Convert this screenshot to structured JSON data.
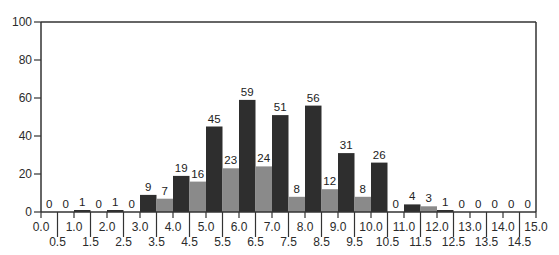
{
  "chart_data": {
    "type": "bar",
    "title": "",
    "xlabel": "",
    "ylabel": "",
    "ylim": [
      0,
      100
    ],
    "xlim": [
      0.0,
      15.0
    ],
    "yticks": [
      0,
      20,
      40,
      60,
      80,
      100
    ],
    "xticks_major": [
      "0.0",
      "1.0",
      "2.0",
      "3.0",
      "4.0",
      "5.0",
      "6.0",
      "7.0",
      "8.0",
      "9.0",
      "10.0",
      "11.0",
      "12.0",
      "13.0",
      "14.0",
      "15.0"
    ],
    "xticks_minor": [
      "0.5",
      "1.5",
      "2.5",
      "3.5",
      "4.5",
      "5.5",
      "6.5",
      "7.5",
      "8.5",
      "9.5",
      "10.5",
      "11.5",
      "12.5",
      "13.5",
      "14.5"
    ],
    "grid": false,
    "legend": null,
    "bin_width": 0.5,
    "bins": [
      {
        "start": 0.0,
        "end": 0.5,
        "value": 0,
        "shade": "dark"
      },
      {
        "start": 0.5,
        "end": 1.0,
        "value": 0,
        "shade": "light"
      },
      {
        "start": 1.0,
        "end": 1.5,
        "value": 1,
        "shade": "dark"
      },
      {
        "start": 1.5,
        "end": 2.0,
        "value": 0,
        "shade": "light"
      },
      {
        "start": 2.0,
        "end": 2.5,
        "value": 1,
        "shade": "dark"
      },
      {
        "start": 2.5,
        "end": 3.0,
        "value": 0,
        "shade": "light"
      },
      {
        "start": 3.0,
        "end": 3.5,
        "value": 9,
        "shade": "dark"
      },
      {
        "start": 3.5,
        "end": 4.0,
        "value": 7,
        "shade": "light"
      },
      {
        "start": 4.0,
        "end": 4.5,
        "value": 19,
        "shade": "dark"
      },
      {
        "start": 4.5,
        "end": 5.0,
        "value": 16,
        "shade": "light"
      },
      {
        "start": 5.0,
        "end": 5.5,
        "value": 45,
        "shade": "dark"
      },
      {
        "start": 5.5,
        "end": 6.0,
        "value": 23,
        "shade": "light"
      },
      {
        "start": 6.0,
        "end": 6.5,
        "value": 59,
        "shade": "dark"
      },
      {
        "start": 6.5,
        "end": 7.0,
        "value": 24,
        "shade": "light"
      },
      {
        "start": 7.0,
        "end": 7.5,
        "value": 51,
        "shade": "dark"
      },
      {
        "start": 7.5,
        "end": 8.0,
        "value": 8,
        "shade": "light"
      },
      {
        "start": 8.0,
        "end": 8.5,
        "value": 56,
        "shade": "dark"
      },
      {
        "start": 8.5,
        "end": 9.0,
        "value": 12,
        "shade": "light"
      },
      {
        "start": 9.0,
        "end": 9.5,
        "value": 31,
        "shade": "dark"
      },
      {
        "start": 9.5,
        "end": 10.0,
        "value": 8,
        "shade": "light"
      },
      {
        "start": 10.0,
        "end": 10.5,
        "value": 26,
        "shade": "dark"
      },
      {
        "start": 10.5,
        "end": 11.0,
        "value": 0,
        "shade": "light"
      },
      {
        "start": 11.0,
        "end": 11.5,
        "value": 4,
        "shade": "dark"
      },
      {
        "start": 11.5,
        "end": 12.0,
        "value": 3,
        "shade": "light"
      },
      {
        "start": 12.0,
        "end": 12.5,
        "value": 1,
        "shade": "dark"
      },
      {
        "start": 12.5,
        "end": 13.0,
        "value": 0,
        "shade": "light"
      },
      {
        "start": 13.0,
        "end": 13.5,
        "value": 0,
        "shade": "dark"
      },
      {
        "start": 13.5,
        "end": 14.0,
        "value": 0,
        "shade": "light"
      },
      {
        "start": 14.0,
        "end": 14.5,
        "value": 0,
        "shade": "dark"
      },
      {
        "start": 14.5,
        "end": 15.0,
        "value": 0,
        "shade": "light"
      }
    ],
    "categories": [
      "0.0-0.5",
      "0.5-1.0",
      "1.0-1.5",
      "1.5-2.0",
      "2.0-2.5",
      "2.5-3.0",
      "3.0-3.5",
      "3.5-4.0",
      "4.0-4.5",
      "4.5-5.0",
      "5.0-5.5",
      "5.5-6.0",
      "6.0-6.5",
      "6.5-7.0",
      "7.0-7.5",
      "7.5-8.0",
      "8.0-8.5",
      "8.5-9.0",
      "9.0-9.5",
      "9.5-10.0",
      "10.0-10.5",
      "10.5-11.0",
      "11.0-11.5",
      "11.5-12.0",
      "12.0-12.5",
      "12.5-13.0",
      "13.0-13.5",
      "13.5-14.0",
      "14.0-14.5",
      "14.5-15.0"
    ],
    "values": [
      0,
      0,
      1,
      0,
      1,
      0,
      9,
      7,
      19,
      16,
      45,
      23,
      59,
      24,
      51,
      8,
      56,
      12,
      31,
      8,
      26,
      0,
      4,
      3,
      1,
      0,
      0,
      0,
      0,
      0
    ],
    "colors": {
      "dark": "#2e2e2e",
      "light": "#8a8a8a",
      "axis": "#333333"
    }
  }
}
